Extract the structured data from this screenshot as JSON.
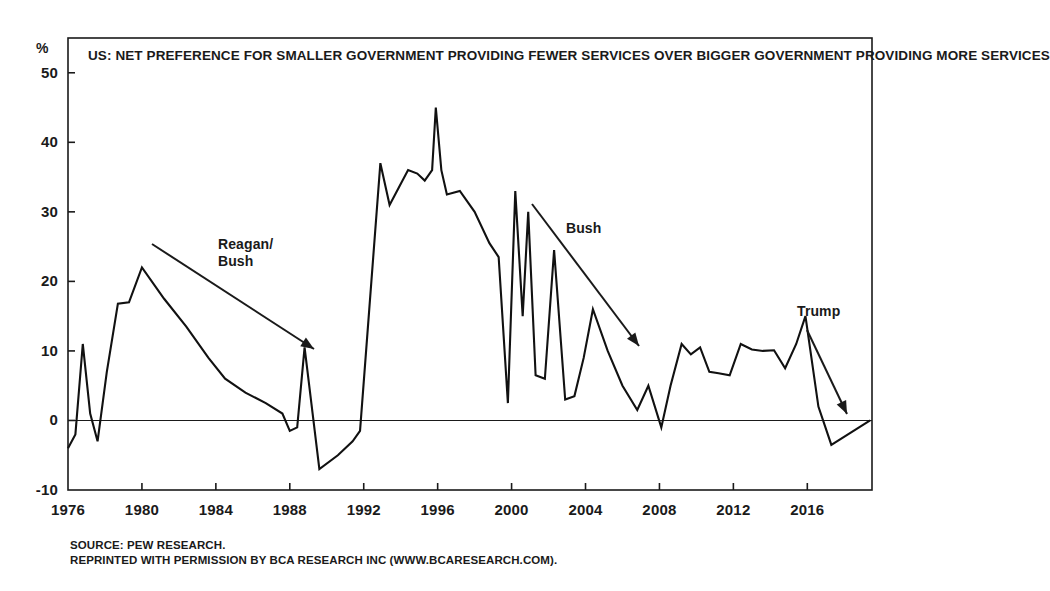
{
  "chart_data": {
    "type": "line",
    "title": "US:\nNET PREFERENCE FOR SMALLER GOVERNMENT PROVIDING FEWER SERVICES OVER\nBIGGER GOVERNMENT PROVIDING MORE SERVICES",
    "title_lines": [
      "US:",
      "NET PREFERENCE FOR SMALLER GOVERNMENT PROVIDING FEWER SERVICES OVER",
      "BIGGER GOVERNMENT PROVIDING MORE SERVICES"
    ],
    "xlabel": "",
    "ylabel": "",
    "yunit": "%",
    "ylim": [
      -10,
      55
    ],
    "xlim": [
      1976,
      2019.5
    ],
    "grid": false,
    "legend": "none",
    "zero_line": 0,
    "yticks": [
      -10,
      0,
      10,
      20,
      30,
      40,
      50
    ],
    "ytick_labels": [
      "-10",
      "0",
      "10",
      "20",
      "30",
      "40",
      "50"
    ],
    "xticks": [
      1976,
      1980,
      1984,
      1988,
      1992,
      1996,
      2000,
      2004,
      2008,
      2012,
      2016
    ],
    "xtick_labels": [
      "1976",
      "1980",
      "1984",
      "1988",
      "1992",
      "1996",
      "2000",
      "2004",
      "2008",
      "2012",
      "2016"
    ],
    "series": [
      {
        "name": "Net preference for smaller government",
        "color": "#111111",
        "x": [
          1976.0,
          1976.4,
          1976.8,
          1977.2,
          1977.6,
          1978.1,
          1978.7,
          1979.3,
          1980.0,
          1981.2,
          1982.4,
          1983.6,
          1984.5,
          1985.6,
          1986.7,
          1987.6,
          1988.0,
          1988.4,
          1988.8,
          1989.6,
          1990.6,
          1991.4,
          1991.8,
          1992.3,
          1992.9,
          1993.4,
          1993.9,
          1994.4,
          1994.9,
          1995.3,
          1995.7,
          1995.9,
          1996.2,
          1996.5,
          1997.2,
          1998.0,
          1998.8,
          1999.3,
          1999.8,
          2000.2,
          2000.6,
          2000.9,
          2001.3,
          2001.8,
          2002.3,
          2002.9,
          2003.4,
          2003.9,
          2004.4,
          2005.2,
          2006.0,
          2006.8,
          2007.4,
          2008.1,
          2008.6,
          2009.2,
          2009.7,
          2010.2,
          2010.7,
          2011.2,
          2011.8,
          2012.4,
          2013.0,
          2013.6,
          2014.2,
          2014.8,
          2015.4,
          2015.9,
          2016.6,
          2017.3,
          2019.4
        ],
        "y": [
          -4.0,
          -2.0,
          11.0,
          1.0,
          -3.0,
          7.0,
          16.8,
          17.0,
          22.0,
          17.5,
          13.5,
          9.0,
          6.0,
          4.0,
          2.5,
          1.0,
          -1.5,
          -1.0,
          10.5,
          -7.0,
          -5.0,
          -3.0,
          -1.5,
          16.0,
          37.0,
          31.0,
          33.5,
          36.0,
          35.5,
          34.5,
          36.0,
          45.0,
          36.0,
          32.5,
          33.0,
          30.0,
          25.5,
          23.5,
          2.5,
          33.0,
          15.0,
          30.0,
          6.5,
          6.0,
          24.5,
          3.0,
          3.5,
          9.0,
          16.0,
          10.0,
          5.0,
          1.5,
          5.0,
          -1.0,
          5.0,
          11.0,
          9.5,
          10.5,
          7.0,
          6.8,
          6.5,
          11.0,
          10.2,
          10.0,
          10.1,
          7.5,
          11.0,
          15.0,
          2.0,
          -3.5,
          0.0
        ]
      }
    ],
    "annotations": [
      {
        "label": "Reagan/\nBush",
        "label_x": 218,
        "label_y": 236,
        "arrow": {
          "x1": 152,
          "y1": 244,
          "x2": 314,
          "y2": 349
        }
      },
      {
        "label": "Bush",
        "label_x": 566,
        "label_y": 220,
        "arrow": {
          "x1": 532,
          "y1": 204,
          "x2": 639,
          "y2": 346
        }
      },
      {
        "label": "Trump",
        "label_x": 797,
        "label_y": 303,
        "arrow": {
          "x1": 807,
          "y1": 330,
          "x2": 847,
          "y2": 414
        }
      }
    ]
  },
  "footnote": {
    "lines": [
      "SOURCE: PEW RESEARCH.",
      "REPRINTED WITH PERMISSION BY BCA RESEARCH INC (WWW.BCARESEARCH.COM)."
    ],
    "text": "SOURCE: PEW RESEARCH.\nREPRINTED WITH PERMISSION BY BCA RESEARCH INC (WWW.BCARESEARCH.COM)."
  },
  "colors": {
    "line": "#111111",
    "frame": "#1a1a1a",
    "text": "#1a1a1a",
    "background": "#ffffff"
  }
}
